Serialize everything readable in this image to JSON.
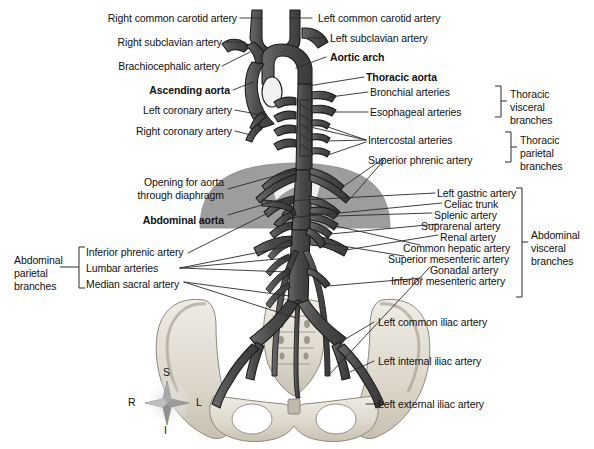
{
  "figure": {
    "orientation_compass": {
      "name": "anatomical-orientation-compass",
      "superior": "S",
      "inferior": "I",
      "right": "R",
      "left": "L"
    },
    "colors": {
      "vessel_dark": "#4a4a4a",
      "vessel_outline": "#1c1c1c",
      "diaphragm_gray": "#9d9d9d",
      "bone_light": "#e4e0d8",
      "bone_shadow": "#b9b2a6",
      "leader_line": "#2a2a2a",
      "background": "#ffffff",
      "text": "#111111"
    }
  },
  "labels_left": [
    {
      "id": "right-common-carotid-artery",
      "text": "Right common carotid artery",
      "bold": false
    },
    {
      "id": "right-subclavian-artery",
      "text": "Right subclavian artery",
      "bold": false
    },
    {
      "id": "brachiocephalic-artery",
      "text": "Brachiocephalic artery",
      "bold": false
    },
    {
      "id": "ascending-aorta",
      "text": "Ascending aorta",
      "bold": true
    },
    {
      "id": "left-coronary-artery",
      "text": "Left coronary artery",
      "bold": false
    },
    {
      "id": "right-coronary-artery",
      "text": "Right coronary artery",
      "bold": false
    },
    {
      "id": "opening-for-aorta-through-diaphragm",
      "text": "Opening for aorta\nthrough diaphragm",
      "bold": false
    },
    {
      "id": "abdominal-aorta",
      "text": "Abdominal aorta",
      "bold": true
    },
    {
      "id": "inferior-phrenic-artery",
      "text": "Inferior phrenic artery",
      "bold": false
    },
    {
      "id": "lumbar-arteries",
      "text": "Lumbar arteries",
      "bold": false
    },
    {
      "id": "median-sacral-artery",
      "text": "Median sacral artery",
      "bold": false
    }
  ],
  "labels_right": [
    {
      "id": "left-common-carotid-artery",
      "text": "Left common carotid artery",
      "bold": false
    },
    {
      "id": "left-subclavian-artery",
      "text": "Left subclavian artery",
      "bold": false
    },
    {
      "id": "aortic-arch",
      "text": "Aortic arch",
      "bold": true
    },
    {
      "id": "thoracic-aorta",
      "text": "Thoracic aorta",
      "bold": true
    },
    {
      "id": "bronchial-arteries",
      "text": "Bronchial arteries",
      "bold": false
    },
    {
      "id": "esophageal-arteries",
      "text": "Esophageal arteries",
      "bold": false
    },
    {
      "id": "intercostal-arteries",
      "text": "Intercostal arteries",
      "bold": false
    },
    {
      "id": "superior-phrenic-artery",
      "text": "Superior phrenic artery",
      "bold": false
    },
    {
      "id": "left-gastric-artery",
      "text": "Left gastric artery",
      "bold": false
    },
    {
      "id": "celiac-trunk",
      "text": "Celiac trunk",
      "bold": false
    },
    {
      "id": "splenic-artery",
      "text": "Splenic artery",
      "bold": false
    },
    {
      "id": "suprarenal-artery",
      "text": "Suprarenal artery",
      "bold": false
    },
    {
      "id": "renal-artery",
      "text": "Renal artery",
      "bold": false
    },
    {
      "id": "common-hepatic-artery",
      "text": "Common hepatic artery",
      "bold": false
    },
    {
      "id": "superior-mesenteric-artery",
      "text": "Superior mesenteric artery",
      "bold": false
    },
    {
      "id": "gonadal-artery",
      "text": "Gonadal artery",
      "bold": false
    },
    {
      "id": "inferior-mesenteric-artery",
      "text": "Inferior mesenteric artery",
      "bold": false
    },
    {
      "id": "left-common-iliac-artery",
      "text": "Left common iliac artery",
      "bold": false
    },
    {
      "id": "left-internal-iliac-artery",
      "text": "Left internal iliac artery",
      "bold": false
    },
    {
      "id": "left-external-iliac-artery",
      "text": "Left external iliac artery",
      "bold": false
    }
  ],
  "group_brackets": [
    {
      "id": "thoracic-visceral-branches",
      "text": "Thoracic\nvisceral\nbranches",
      "side": "right"
    },
    {
      "id": "thoracic-parietal-branches",
      "text": "Thoracic\nparietal\nbranches",
      "side": "right"
    },
    {
      "id": "abdominal-visceral-branches",
      "text": "Abdominal\nvisceral\nbranches",
      "side": "right"
    },
    {
      "id": "abdominal-parietal-branches",
      "text": "Abdominal\nparietal\nbranches",
      "side": "left"
    }
  ]
}
